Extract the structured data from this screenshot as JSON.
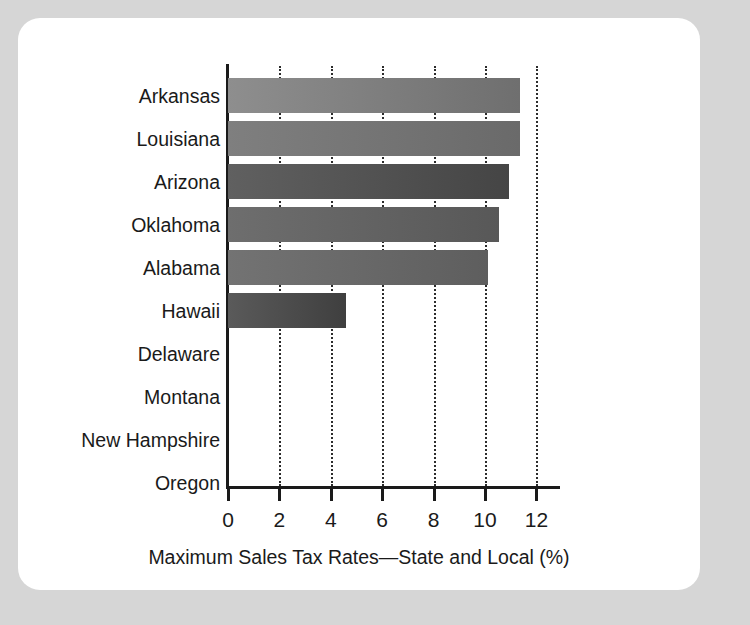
{
  "chart_data": {
    "type": "bar",
    "orientation": "horizontal",
    "title": "",
    "xlabel": "Maximum Sales Tax Rates—State and Local (%)",
    "ylabel": "",
    "xlim": [
      0,
      12.84
    ],
    "xticks": [
      0,
      2,
      4,
      6,
      8,
      10,
      12
    ],
    "xtick_labels": [
      "0",
      "2",
      "4",
      "6",
      "8",
      "10",
      "12"
    ],
    "grid": "vertical-dotted",
    "legend": "none",
    "categories": [
      "Arkansas",
      "Louisiana",
      "Arizona",
      "Oklahoma",
      "Alabama",
      "Hawaii",
      "Delaware",
      "Montana",
      "New Hampshire",
      "Oregon"
    ],
    "values": [
      11.35,
      11.35,
      10.95,
      10.55,
      10.1,
      4.6,
      0,
      0,
      0,
      0
    ],
    "bar_colors": [
      "#8e8e8e",
      "#7f7f7f",
      "#606060",
      "#6e6e6e",
      "#737373",
      "#5a5a5a",
      "#808080",
      "#808080",
      "#808080",
      "#808080"
    ],
    "bar_colors_end": [
      "#6f6f6f",
      "#6a6a6a",
      "#454545",
      "#585858",
      "#5e5e5e",
      "#3f3f3f",
      "#808080",
      "#808080",
      "#808080",
      "#808080"
    ]
  },
  "colors": {
    "page_background": "#d6d6d6",
    "card_background": "#ffffff",
    "axis": "#1a1a1a",
    "grid": "#2c2c2c",
    "text": "#1a1a1a"
  }
}
